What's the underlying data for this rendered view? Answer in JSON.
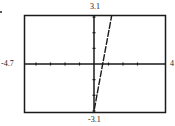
{
  "chart_data": {
    "type": "line",
    "title": "",
    "xlabel": "",
    "ylabel": "",
    "window": {
      "xmin": -4.7,
      "xmax": 4,
      "ymin": -3.1,
      "ymax": 3.1,
      "xscl": 1,
      "yscl": 1
    },
    "window_labels": {
      "xmin": "-4.7",
      "xmax": "4",
      "ymin": "-3.1",
      "ymax": "3.1"
    },
    "xlim": [
      -4.7,
      4
    ],
    "ylim": [
      -3.1,
      3.1
    ],
    "grid": false,
    "legend": null,
    "x_ticks": [
      -4,
      -3,
      -2,
      -1,
      1,
      2,
      3
    ],
    "y_ticks": [
      -3,
      -2,
      -1,
      1,
      2,
      3
    ],
    "series": [
      {
        "name": "line",
        "equation_estimate": "y = 5x - 3",
        "x": [
          0.02,
          0.6,
          1.22
        ],
        "y": [
          -2.9,
          0,
          3.1
        ]
      }
    ]
  },
  "colors": {
    "axis": "#1a1a1a",
    "frame": "#1a1a1a",
    "line": "#1a1a1a",
    "background": "#ffffff"
  }
}
